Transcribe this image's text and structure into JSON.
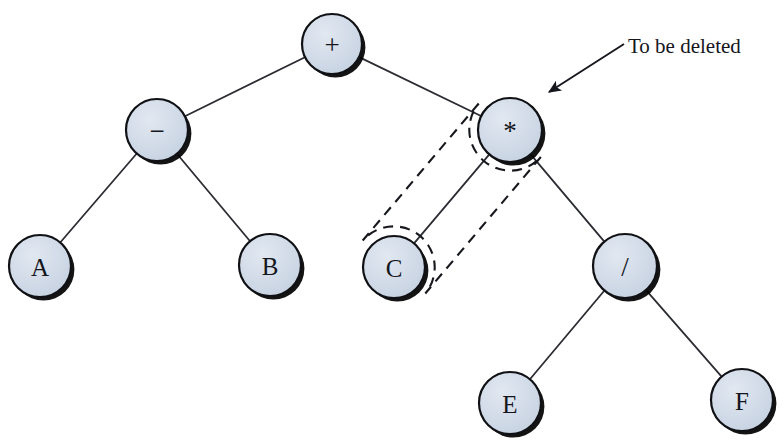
{
  "figure": {
    "background_color": "#ffffff",
    "width": 784,
    "height": 443
  },
  "style": {
    "node_fill": "#ccd7e5",
    "node_stroke": "#101114",
    "node_shadow": "#000000",
    "edge_color": "#2b2d33",
    "dashed_color": "#16181d",
    "text_color": "#14161c"
  },
  "annotation": {
    "label": "To be deleted",
    "text_x": 628,
    "text_y": 53,
    "arrow_from_x": 624,
    "arrow_from_y": 44,
    "arrow_to_x": 549,
    "arrow_to_y": 92
  },
  "enclosure": {
    "shape": "capsule",
    "node_ids": [
      "mul",
      "C"
    ],
    "radius": 41,
    "dash": "10 7"
  },
  "nodes": [
    {
      "id": "plus",
      "label": "+",
      "kind": "operator",
      "cx": 332,
      "cy": 44,
      "r": 30
    },
    {
      "id": "minus",
      "label": "−",
      "kind": "operator",
      "cx": 157,
      "cy": 130,
      "r": 31
    },
    {
      "id": "mul",
      "label": "*",
      "kind": "operator",
      "cx": 510,
      "cy": 130,
      "r": 32
    },
    {
      "id": "A",
      "label": "A",
      "kind": "operand",
      "cx": 40,
      "cy": 266,
      "r": 31
    },
    {
      "id": "B",
      "label": "B",
      "kind": "operand",
      "cx": 270,
      "cy": 265,
      "r": 31
    },
    {
      "id": "C",
      "label": "C",
      "kind": "operand",
      "cx": 394,
      "cy": 267,
      "r": 31
    },
    {
      "id": "div",
      "label": "/",
      "kind": "operator",
      "cx": 625,
      "cy": 266,
      "r": 32
    },
    {
      "id": "E",
      "label": "E",
      "kind": "operand",
      "cx": 510,
      "cy": 403,
      "r": 31
    },
    {
      "id": "F",
      "label": "F",
      "kind": "operand",
      "cx": 742,
      "cy": 400,
      "r": 31
    }
  ],
  "edges": [
    {
      "from": "plus",
      "to": "minus"
    },
    {
      "from": "plus",
      "to": "mul"
    },
    {
      "from": "minus",
      "to": "A"
    },
    {
      "from": "minus",
      "to": "B"
    },
    {
      "from": "mul",
      "to": "C"
    },
    {
      "from": "mul",
      "to": "div"
    },
    {
      "from": "div",
      "to": "E"
    },
    {
      "from": "div",
      "to": "F"
    }
  ]
}
